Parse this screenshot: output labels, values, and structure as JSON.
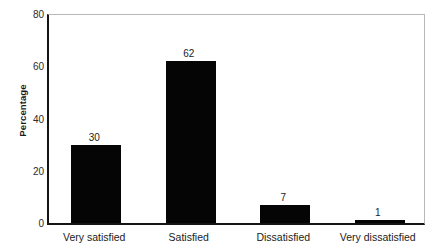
{
  "chart_data": {
    "type": "bar",
    "title": "",
    "xlabel": "",
    "ylabel": "Percentage",
    "categories": [
      "Very satisfied",
      "Satisfied",
      "Dissatisfied",
      "Very dissatisfied"
    ],
    "values": [
      30,
      62,
      7,
      1
    ],
    "value_labels": [
      "30",
      "62",
      "7",
      "1"
    ],
    "ylim": [
      0,
      80
    ],
    "yticks": [
      0,
      20,
      40,
      60,
      80
    ],
    "ytick_labels": [
      "0",
      "20",
      "40",
      "60",
      "80"
    ],
    "grid": false,
    "legend": null,
    "bar_color": "#050505",
    "axis_color": "#141414",
    "frame_color": "#b8b8b8",
    "background": "#ffffff"
  }
}
